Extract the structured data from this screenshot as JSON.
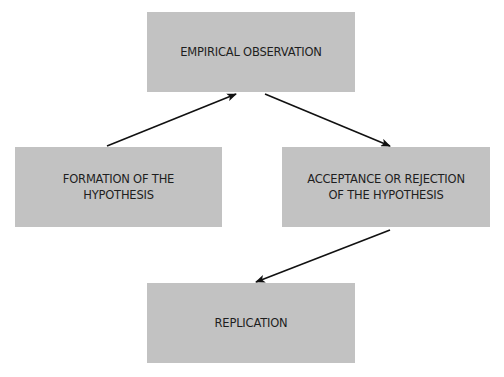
{
  "diagram": {
    "nodes": [
      {
        "id": "empirical-observation",
        "lines": [
          "EMPIRICAL OBSERVATION"
        ]
      },
      {
        "id": "formation-of-hypothesis",
        "lines": [
          "FORMATION OF THE",
          "HYPOTHESIS"
        ]
      },
      {
        "id": "acceptance-rejection",
        "lines": [
          "ACCEPTANCE OR REJECTION",
          "OF THE HYPOTHESIS"
        ]
      },
      {
        "id": "replication",
        "lines": [
          "REPLICATION"
        ]
      }
    ],
    "edges": [
      {
        "from": "formation-of-hypothesis",
        "to": "empirical-observation"
      },
      {
        "from": "empirical-observation",
        "to": "acceptance-rejection"
      },
      {
        "from": "acceptance-rejection",
        "to": "replication"
      }
    ],
    "colors": {
      "box_fill": "#c2c2c2",
      "text": "#1e1e1e",
      "arrow": "#111111"
    }
  }
}
